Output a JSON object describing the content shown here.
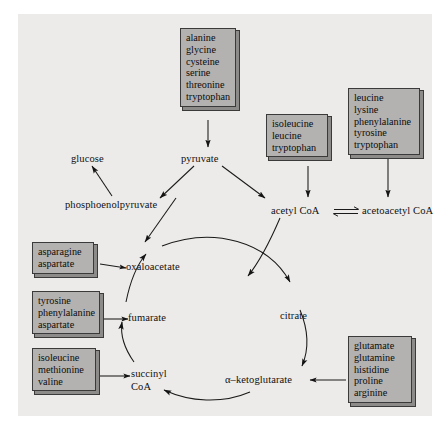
{
  "figure": {
    "canvas_color": "#ecebe9",
    "box_fill": "#b4b2b0",
    "box_edge": "#3a3a3a",
    "stroke_color": "#1a1a1a"
  },
  "metabolites": {
    "glucose": "glucose",
    "pyruvate": "pyruvate",
    "phosphoenolpyruvate": "phosphoenolpyruvate",
    "acetyl_coa": "acetyl CoA",
    "acetoacetyl_coa": "acetoacetyl CoA",
    "oxaloacetate": "oxaloacetate",
    "citrate": "citrate",
    "fumarate": "fumarate",
    "succinyl_coa_line1": "succinyl",
    "succinyl_coa_line2": "CoA",
    "alpha_ketoglutarate": "α–ketoglutarate"
  },
  "amino_acid_boxes": [
    {
      "id": "box-pyruvate-precursors",
      "target": "pyruvate",
      "items": [
        "alanine",
        "glycine",
        "cysteine",
        "serine",
        "threonine",
        "tryptophan"
      ]
    },
    {
      "id": "box-acetyl-coa-precursors",
      "target": "acetyl CoA",
      "items": [
        "isoleucine",
        "leucine",
        "tryptophan"
      ]
    },
    {
      "id": "box-acetoacetyl-coa-precursors",
      "target": "acetoacetyl CoA",
      "items": [
        "leucine",
        "lysine",
        "phenylalanine",
        "tyrosine",
        "tryptophan"
      ]
    },
    {
      "id": "box-oxaloacetate-precursors",
      "target": "oxaloacetate",
      "items": [
        "asparagine",
        "aspartate"
      ]
    },
    {
      "id": "box-fumarate-precursors",
      "target": "fumarate",
      "items": [
        "tyrosine",
        "phenylalanine",
        "aspartate"
      ]
    },
    {
      "id": "box-succinyl-coa-precursors",
      "target": "succinyl CoA",
      "items": [
        "isoleucine",
        "methionine",
        "valine"
      ]
    },
    {
      "id": "box-alpha-ketoglutarate-precursors",
      "target": "α–ketoglutarate",
      "items": [
        "glutamate",
        "glutamine",
        "histidine",
        "proline",
        "arginine"
      ]
    }
  ]
}
